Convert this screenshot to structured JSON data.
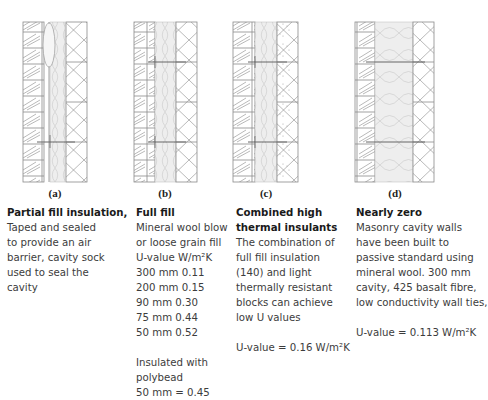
{
  "colors": {
    "line": "#8a8a8a",
    "insulation_fill": "#ececec",
    "text": "#3c3c3c"
  },
  "panels": [
    {
      "id": "a",
      "label": "(a)",
      "title": "Partial fill insulation,",
      "lines": [
        "Taped and sealed",
        "to provide an air",
        "barrier, cavity sock",
        "used to seal the",
        "cavity"
      ]
    },
    {
      "id": "b",
      "label": "(b)",
      "title": "Full fill",
      "lines": [
        "Mineral wool blow",
        "or loose grain fill",
        "U-value W/m²K",
        "300 mm 0.11",
        "200 mm 0.15",
        "90 mm 0.30",
        "75 mm 0.44",
        "50 mm 0.52"
      ],
      "extra_lines": [
        "Insulated with",
        "polybead",
        "50 mm = 0.45"
      ]
    },
    {
      "id": "c",
      "label": "(c)",
      "title_lines": [
        "Combined high",
        "thermal insulants"
      ],
      "lines": [
        "The combination of",
        "full fill insulation",
        "(140) and light",
        "thermally resistant",
        "blocks can achieve",
        "low U values"
      ],
      "uvalue": "U-value = 0.16 W/m²K"
    },
    {
      "id": "d",
      "label": "(d)",
      "title": "Nearly zero",
      "lines": [
        "Masonry cavity walls",
        "have been built to",
        "passive standard using",
        "mineral wool. 300 mm",
        "cavity, 425 basalt fibre,",
        "low conductivity wall ties,"
      ],
      "uvalue": "U-value = 0.113 W/m²K"
    }
  ]
}
